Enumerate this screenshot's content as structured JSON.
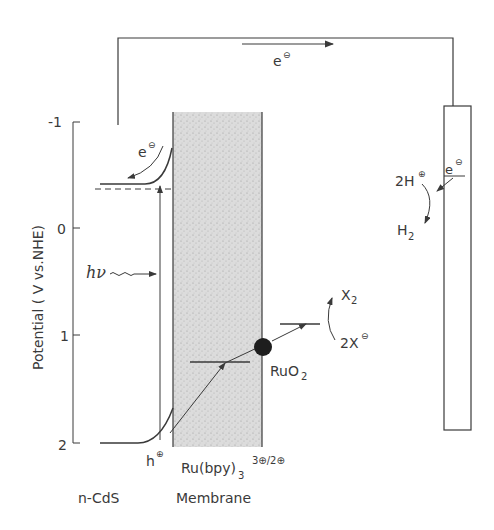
{
  "axis": {
    "label": "Potential ( V vs.NHE)",
    "ticks": [
      "-1",
      "0",
      "1",
      "2"
    ]
  },
  "labels": {
    "external_electron": "e",
    "cds_electron": "e",
    "h_nu": "hν",
    "hole": "h",
    "ru_complex_base": "Ru(bpy)",
    "ru_complex_sub": "3",
    "ru_complex_sup": "3⊕/2⊕",
    "ruo2": "RuO",
    "ruo2_sub": "2",
    "x2": "X",
    "x2_sub": "2",
    "two_x_minus": "2X",
    "two_h_plus": "2H",
    "h2": "H",
    "h2_sub": "2",
    "cathode_electron": "e",
    "minus_sign": "⊖",
    "plus_sign": "⊕"
  },
  "bottom_labels": {
    "semiconductor": "n-CdS",
    "membrane": "Membrane"
  },
  "colors": {
    "line": "#3a3a3a",
    "membrane_fill": "#d8d8d8",
    "catalyst": "#1e1e1e"
  }
}
